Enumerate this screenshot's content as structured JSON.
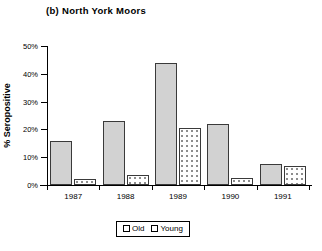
{
  "chart_data": {
    "type": "bar",
    "title": "(b) North York Moors",
    "xlabel": "",
    "ylabel": "% Seropositive",
    "categories": [
      "1987",
      "1988",
      "1989",
      "1990",
      "1991"
    ],
    "series": [
      {
        "name": "Old",
        "values": [
          16,
          23,
          44,
          22,
          7.5
        ]
      },
      {
        "name": "Young",
        "values": [
          2,
          3.5,
          20.5,
          2.5,
          7
        ]
      }
    ],
    "ylim": [
      0,
      50
    ],
    "ytick_values": [
      0,
      10,
      20,
      30,
      40,
      50
    ],
    "ytick_labels": [
      "0%",
      "10%",
      "20%",
      "30%",
      "40%",
      "50%"
    ],
    "grid": false,
    "legend_position": "bottom-center",
    "legend_entries": [
      "Old",
      "Young"
    ],
    "colors": {
      "old_fill": "#d2d2d2",
      "young_fill": "#ffffff",
      "bar_outline": "#3a3a3a",
      "axis": "#000000",
      "background": "#ffffff"
    }
  },
  "legend": {
    "old_label": "Old",
    "young_label": "Young"
  }
}
